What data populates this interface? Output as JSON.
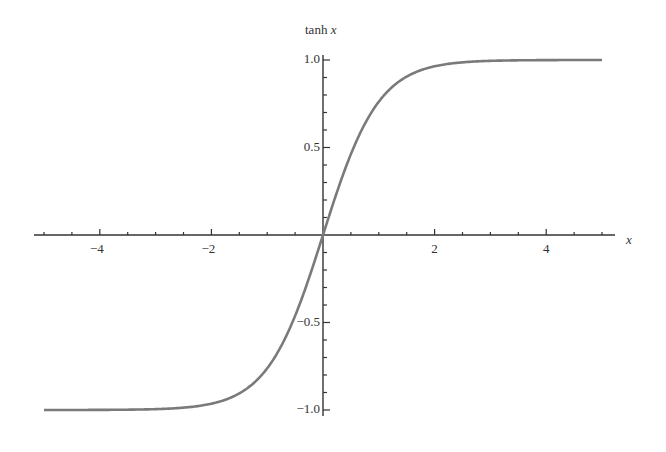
{
  "chart_data": {
    "type": "line",
    "title": "",
    "xlabel": "x",
    "ylabel": "tanh x",
    "function": "tanh(x)",
    "xlim": [
      -5,
      5
    ],
    "ylim": [
      -1,
      1
    ],
    "grid": false,
    "legend": null,
    "x_ticks": [
      -4,
      -2,
      2,
      4
    ],
    "x_tick_labels": [
      "-4",
      "-2",
      "2",
      "4"
    ],
    "y_ticks": [
      -1.0,
      -0.5,
      0.5,
      1.0
    ],
    "y_tick_labels": [
      "-1.0",
      "-0.5",
      "0.5",
      "1.0"
    ],
    "series": [
      {
        "name": "tanh x",
        "x": [
          -5,
          -4,
          -3,
          -2,
          -1.5,
          -1,
          -0.5,
          0,
          0.5,
          1,
          1.5,
          2,
          3,
          4,
          5
        ],
        "y": [
          -0.9999,
          -0.9993,
          -0.9951,
          -0.964,
          -0.9051,
          -0.7616,
          -0.4621,
          0,
          0.4621,
          0.7616,
          0.9051,
          0.964,
          0.9951,
          0.9993,
          0.9999
        ]
      }
    ],
    "colors": {
      "curve": "#7a7a7a",
      "axes": "#333333",
      "text": "#333333"
    }
  }
}
